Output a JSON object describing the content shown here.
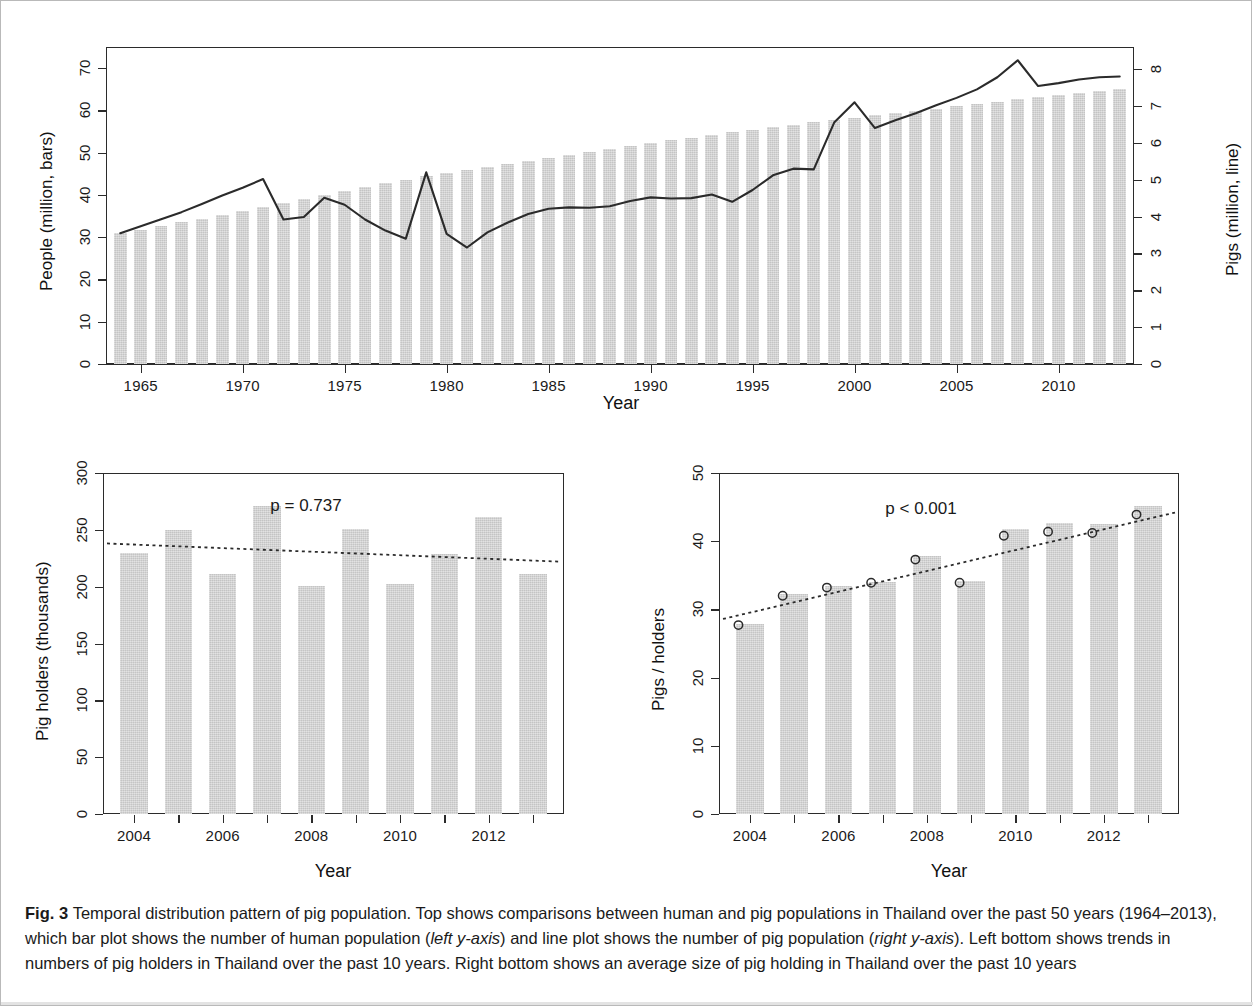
{
  "figure": {
    "label": "Fig. 3",
    "caption_parts": [
      {
        "t": "Temporal distribution pattern of pig population. Top shows comparisons between human and pig populations in Thailand over the past 50 years (1964–2013), which bar plot shows the number of human population ("
      },
      {
        "t": "left y-axis",
        "i": true
      },
      {
        "t": ") and line plot shows the number of pig population ("
      },
      {
        "t": "right y-axis",
        "i": true
      },
      {
        "t": "). Left bottom shows trends in numbers of pig holders in Thailand over the past 10 years. Right bottom shows an average size of pig holding in Thailand over the past 10 years"
      }
    ],
    "caption_text": "Temporal distribution pattern of pig population. Top shows comparisons between human and pig populations in Thailand over the past 50 years (1964–2013), which bar plot shows the number of human population (left y-axis) and line plot shows the number of pig population (right y-axis). Left bottom shows trends in numbers of pig holders in Thailand over the past 10 years. Right bottom shows an average size of pig holding in Thailand over the past 10 years"
  },
  "colors": {
    "bar_fill": "#d2d2d2",
    "line_stroke": "#2b2b2b",
    "axis": "#2b2b2b",
    "text": "#1a1a1a",
    "frame": "#b9b9b9"
  },
  "chart_data": [
    {
      "id": "top",
      "type": "bar",
      "title": "",
      "xlabel": "Year",
      "ylabel": "People (million, bars)",
      "y2label": "Pigs (million, line)",
      "xlim": [
        1963.3,
        2013.7
      ],
      "ylim": [
        0,
        75
      ],
      "y2lim": [
        0,
        8.6
      ],
      "yticks": [
        0,
        10,
        20,
        30,
        40,
        50,
        60,
        70
      ],
      "y2ticks": [
        0,
        1,
        2,
        3,
        4,
        5,
        6,
        7,
        8
      ],
      "xticks": [
        1965,
        1970,
        1975,
        1980,
        1985,
        1990,
        1995,
        2000,
        2005,
        2010
      ],
      "grid": false,
      "legend": "none",
      "x": [
        1964,
        1965,
        1966,
        1967,
        1968,
        1969,
        1970,
        1971,
        1972,
        1973,
        1974,
        1975,
        1976,
        1977,
        1978,
        1979,
        1980,
        1981,
        1982,
        1983,
        1984,
        1985,
        1986,
        1987,
        1988,
        1989,
        1990,
        1991,
        1992,
        1993,
        1994,
        1995,
        1996,
        1997,
        1998,
        1999,
        2000,
        2001,
        2002,
        2003,
        2004,
        2005,
        2006,
        2007,
        2008,
        2009,
        2010,
        2011,
        2012,
        2013
      ],
      "series": [
        {
          "name": "People (million, bars)",
          "kind": "bar",
          "axis": "left",
          "values": [
            30.9,
            31.7,
            32.6,
            33.5,
            34.4,
            35.3,
            36.2,
            37.1,
            38.0,
            39.0,
            40.0,
            41.0,
            41.9,
            42.8,
            43.6,
            44.4,
            45.2,
            46.0,
            46.7,
            47.4,
            48.1,
            48.8,
            49.4,
            50.1,
            50.8,
            51.5,
            52.2,
            52.9,
            53.5,
            54.1,
            54.8,
            55.4,
            56.0,
            56.6,
            57.2,
            57.7,
            58.2,
            58.8,
            59.3,
            59.9,
            60.4,
            61.0,
            61.5,
            62.1,
            62.6,
            63.1,
            63.7,
            64.2,
            64.7,
            65.1
          ]
        },
        {
          "name": "Pigs (million, line)",
          "kind": "line",
          "axis": "right",
          "values": [
            3.55,
            3.74,
            3.93,
            4.12,
            4.34,
            4.57,
            4.78,
            5.02,
            3.92,
            3.99,
            4.51,
            4.32,
            3.92,
            3.62,
            3.4,
            5.2,
            3.53,
            3.16,
            3.57,
            3.84,
            4.07,
            4.21,
            4.25,
            4.24,
            4.28,
            4.42,
            4.52,
            4.49,
            4.5,
            4.6,
            4.4,
            4.72,
            5.12,
            5.3,
            5.28,
            6.55,
            7.1,
            6.4,
            6.61,
            6.8,
            7.02,
            7.22,
            7.45,
            7.78,
            8.24,
            7.54,
            7.62,
            7.72,
            7.78,
            7.8
          ]
        }
      ]
    },
    {
      "id": "bottom_left",
      "type": "bar",
      "title": "",
      "xlabel": "Year",
      "ylabel": "Pig holders (thousands)",
      "annotation": "p = 0.737",
      "xlim": [
        2003.3,
        2013.7
      ],
      "ylim": [
        0,
        300
      ],
      "yticks": [
        0,
        50,
        100,
        150,
        200,
        250,
        300
      ],
      "xticks": [
        2004,
        2006,
        2008,
        2010,
        2012
      ],
      "grid": false,
      "legend": "none",
      "categories": [
        2004,
        2005,
        2006,
        2007,
        2008,
        2009,
        2010,
        2011,
        2012,
        2013
      ],
      "values": [
        230,
        250,
        211,
        271,
        201,
        251,
        202,
        229,
        261,
        211
      ],
      "trendline": {
        "style": "dotted",
        "y_start": 238,
        "y_end": 222
      }
    },
    {
      "id": "bottom_right",
      "type": "bar",
      "title": "",
      "xlabel": "Year",
      "ylabel": "Pigs / holders",
      "annotation": "p < 0.001",
      "xlim": [
        2003.3,
        2013.7
      ],
      "ylim": [
        0,
        50
      ],
      "yticks": [
        0,
        10,
        20,
        30,
        40,
        50
      ],
      "xticks": [
        2004,
        2006,
        2008,
        2010,
        2012
      ],
      "grid": false,
      "legend": "none",
      "categories": [
        2004,
        2005,
        2006,
        2007,
        2008,
        2009,
        2010,
        2011,
        2012,
        2013
      ],
      "values": [
        27.8,
        32.2,
        33.5,
        34.0,
        37.8,
        34.2,
        41.8,
        42.6,
        42.5,
        45.1
      ],
      "points": [
        27.7,
        32.0,
        33.2,
        33.9,
        37.3,
        33.9,
        40.8,
        41.4,
        41.2,
        43.9
      ],
      "trendline": {
        "style": "dotted",
        "y_start": 28.6,
        "y_end": 44.2
      }
    }
  ]
}
